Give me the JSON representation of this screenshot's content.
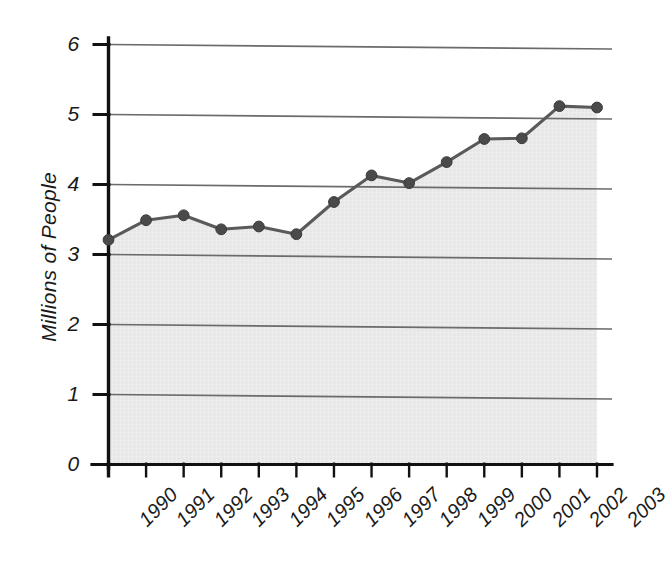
{
  "figure": {
    "background_color": "#ffffff",
    "area_fill_color": "#e6e6e6",
    "line_color": "#5a5a5a",
    "marker_color": "#4a4a4a",
    "axis_color": "#111111",
    "gridline_color": "#6b6b6b"
  },
  "chart_data": {
    "type": "line",
    "title": "",
    "subtitle": "",
    "xlabel": "",
    "ylabel": "Millions of People",
    "x": [
      1990,
      1991,
      1992,
      1993,
      1994,
      1995,
      1996,
      1997,
      1998,
      1999,
      2000,
      2001,
      2002,
      2003
    ],
    "categories": [
      "1990",
      "1991",
      "1992",
      "1993",
      "1994",
      "1995",
      "1996",
      "1997",
      "1998",
      "1999",
      "2000",
      "2001",
      "2002",
      "2003"
    ],
    "values": [
      3.21,
      3.49,
      3.56,
      3.36,
      3.4,
      3.29,
      3.75,
      4.13,
      4.02,
      4.32,
      4.65,
      4.66,
      5.12,
      5.1
    ],
    "series": [
      {
        "name": "Millions of People",
        "values": [
          3.21,
          3.49,
          3.56,
          3.36,
          3.4,
          3.29,
          3.75,
          4.13,
          4.02,
          4.32,
          4.65,
          4.66,
          5.12,
          5.1
        ]
      }
    ],
    "ylim": [
      0,
      6
    ],
    "xlim": [
      1990,
      2003
    ],
    "yticks": [
      0,
      1,
      2,
      3,
      4,
      5,
      6
    ],
    "ytick_labels": [
      "0",
      "1",
      "2",
      "3",
      "4",
      "5",
      "6"
    ],
    "xtick_labels": [
      "1990",
      "1991",
      "1992",
      "1993",
      "1994",
      "1995",
      "1996",
      "1997",
      "1998",
      "1999",
      "2000",
      "2001",
      "2002",
      "2003"
    ],
    "grid": true,
    "grid_axis": "y",
    "legend": false,
    "legend_position": "none",
    "markers": true,
    "fill_under_line": true,
    "annotations": []
  }
}
